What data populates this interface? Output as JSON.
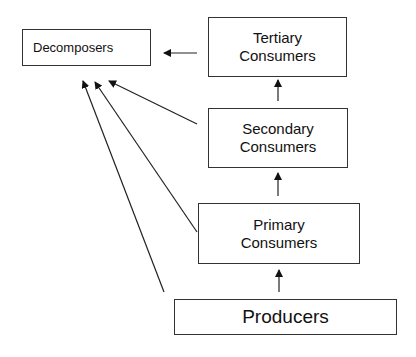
{
  "nodes": {
    "decomposers": {
      "label": "Decomposers"
    },
    "tertiary": {
      "line1": "Tertiary",
      "line2": "Consumers"
    },
    "secondary": {
      "line1": "Secondary",
      "line2": "Consumers"
    },
    "primary": {
      "line1": "Primary",
      "line2": "Consumers"
    },
    "producers": {
      "label": "Producers"
    }
  },
  "edges": [
    {
      "from": "producers",
      "to": "primary"
    },
    {
      "from": "primary",
      "to": "secondary"
    },
    {
      "from": "secondary",
      "to": "tertiary"
    },
    {
      "from": "tertiary",
      "to": "decomposers"
    },
    {
      "from": "secondary",
      "to": "decomposers"
    },
    {
      "from": "primary",
      "to": "decomposers"
    },
    {
      "from": "producers",
      "to": "decomposers"
    }
  ]
}
